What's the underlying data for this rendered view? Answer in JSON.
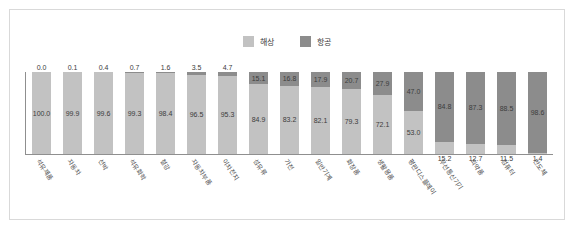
{
  "chart_data": {
    "type": "bar",
    "stacked": true,
    "orientation": "vertical",
    "title": "",
    "subtitle": "",
    "xlabel": "",
    "ylabel": "",
    "ylim": [
      0,
      100
    ],
    "grid": false,
    "legend_position": "top-center",
    "unit": "%",
    "categories": [
      "석유제품",
      "자동차",
      "선박",
      "석유화학",
      "철강",
      "자동차부품",
      "이차전지",
      "섬유류",
      "가전",
      "일반기계",
      "화장품",
      "생활용품",
      "평판디스플레이",
      "무선통신기기",
      "의약품",
      "컴퓨터",
      "반도체"
    ],
    "series": [
      {
        "name": "해상",
        "color": "#c2c2c2",
        "values": [
          100.0,
          99.9,
          99.6,
          99.3,
          98.4,
          96.5,
          95.3,
          84.9,
          83.2,
          82.1,
          79.3,
          72.1,
          53.0,
          15.2,
          12.7,
          11.5,
          1.4
        ]
      },
      {
        "name": "항공",
        "color": "#8c8c8c",
        "values": [
          0.0,
          0.1,
          0.4,
          0.7,
          1.6,
          3.5,
          4.7,
          15.1,
          16.8,
          17.9,
          20.7,
          27.9,
          47.0,
          84.8,
          87.3,
          88.5,
          98.6
        ]
      }
    ]
  },
  "legend": {
    "entries": [
      {
        "label": "해상",
        "color": "#c2c2c2"
      },
      {
        "label": "항공",
        "color": "#8c8c8c"
      }
    ]
  }
}
